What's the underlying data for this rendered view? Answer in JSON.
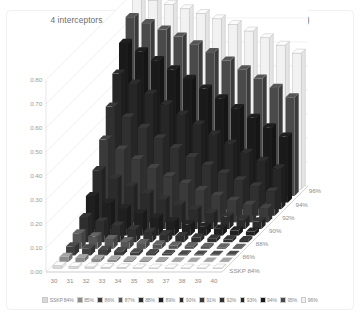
{
  "chart_data": {
    "type": "bar",
    "subtype": "3d-column",
    "title": "4 interceptors, SSKP 84-96%, 30-40 attacking warheads (in a salvo)",
    "xlabel": "",
    "ylabel": "",
    "zlabel": "SSKP",
    "grid": true,
    "legend_position": "bottom",
    "ylim": [
      0.0,
      0.8
    ],
    "ytick_labels": [
      "0.00",
      "0.10",
      "0.20",
      "0.30",
      "0.40",
      "0.50",
      "0.60",
      "0.70",
      "0.80"
    ],
    "ytick_values": [
      0.0,
      0.1,
      0.2,
      0.3,
      0.4,
      0.5,
      0.6,
      0.7,
      0.8
    ],
    "categories": [
      "30",
      "31",
      "32",
      "33",
      "34",
      "35",
      "36",
      "37",
      "38",
      "39",
      "40"
    ],
    "depth_axis_labels": [
      "SSKP 84%",
      "86%",
      "88%",
      "90%",
      "92%",
      "94%",
      "96%"
    ],
    "series": [
      {
        "name": "SSKP 84%",
        "color": "#d9d9d9",
        "values": [
          0.012,
          0.009,
          0.007,
          0.005,
          0.004,
          0.003,
          0.002,
          0.0015,
          0.001,
          0.0008,
          0.0005
        ]
      },
      {
        "name": "85%",
        "color": "#8c8c8c",
        "values": [
          0.022,
          0.017,
          0.013,
          0.01,
          0.007,
          0.005,
          0.004,
          0.003,
          0.002,
          0.0015,
          0.001
        ]
      },
      {
        "name": "86%",
        "color": "#3f3f3f",
        "values": [
          0.038,
          0.03,
          0.023,
          0.018,
          0.013,
          0.01,
          0.007,
          0.005,
          0.004,
          0.003,
          0.002
        ]
      },
      {
        "name": "87%",
        "color": "#555555",
        "values": [
          0.065,
          0.052,
          0.041,
          0.032,
          0.024,
          0.019,
          0.014,
          0.011,
          0.008,
          0.006,
          0.004
        ]
      },
      {
        "name": "88%",
        "color": "#2e2e2e",
        "values": [
          0.105,
          0.086,
          0.069,
          0.055,
          0.043,
          0.034,
          0.026,
          0.02,
          0.015,
          0.012,
          0.009
        ]
      },
      {
        "name": "89%",
        "color": "#1f1f1f",
        "values": [
          0.165,
          0.138,
          0.114,
          0.093,
          0.075,
          0.06,
          0.047,
          0.037,
          0.029,
          0.022,
          0.017
        ]
      },
      {
        "name": "90%",
        "color": "#2b2b2b",
        "values": [
          0.245,
          0.21,
          0.178,
          0.149,
          0.123,
          0.101,
          0.082,
          0.066,
          0.052,
          0.041,
          0.032
        ]
      },
      {
        "name": "91%",
        "color": "#3a3a3a",
        "values": [
          0.345,
          0.303,
          0.263,
          0.226,
          0.192,
          0.162,
          0.135,
          0.111,
          0.09,
          0.073,
          0.058
        ]
      },
      {
        "name": "92%",
        "color": "#303030",
        "values": [
          0.455,
          0.41,
          0.366,
          0.323,
          0.282,
          0.244,
          0.209,
          0.177,
          0.148,
          0.123,
          0.101
        ]
      },
      {
        "name": "93%",
        "color": "#262626",
        "values": [
          0.565,
          0.523,
          0.48,
          0.437,
          0.394,
          0.352,
          0.311,
          0.272,
          0.235,
          0.201,
          0.17
        ]
      },
      {
        "name": "94%",
        "color": "#1a1a1a",
        "values": [
          0.665,
          0.63,
          0.593,
          0.555,
          0.515,
          0.475,
          0.434,
          0.393,
          0.353,
          0.313,
          0.275
        ]
      },
      {
        "name": "95%",
        "color": "#4a4a4a",
        "values": [
          0.745,
          0.72,
          0.693,
          0.664,
          0.632,
          0.599,
          0.564,
          0.527,
          0.489,
          0.45,
          0.411
        ]
      },
      {
        "name": "96%",
        "color": "#f2f2f2",
        "values": [
          0.8,
          0.786,
          0.77,
          0.752,
          0.732,
          0.71,
          0.686,
          0.659,
          0.631,
          0.6,
          0.567
        ]
      }
    ]
  }
}
